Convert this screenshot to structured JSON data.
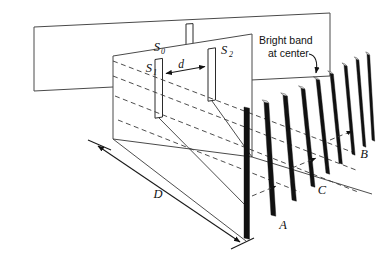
{
  "figure": {
    "type": "physics-diagram",
    "background_color": "#ffffff",
    "line_color": "#3a3a3a",
    "band_color": "#111111"
  },
  "labels": {
    "source_slit": "S",
    "source_slit_sub": "0",
    "slit_one": "S",
    "slit_one_sub": "1",
    "slit_two": "S",
    "slit_two_sub": "2",
    "slit_separation": "d",
    "screen_distance": "D",
    "fringe_a": "A",
    "fringe_b": "B",
    "fringe_c": "C",
    "callout_line1": "Bright band",
    "callout_line2": "at center"
  },
  "geometry": {
    "source_plane": {
      "points": "34,27 330,13 330,76 34,91",
      "slit": {
        "x": 188,
        "y": 23,
        "w": 7,
        "h": 45
      }
    },
    "double_slit_plane": {
      "points": "113,56 252,34 252,157 113,139",
      "slit_one": {
        "points": "155,59 163,58 163,117 155,118"
      },
      "slit_two": {
        "points": "208,48 216,47 216,100 208,101"
      }
    },
    "rays_solid": [
      "M66,48 L155,88",
      "M66,48 L163,72",
      "M66,48 L208,72",
      "M66,48 L216,57"
    ],
    "rays_dashed": [
      "M113,66 L340,150",
      "M113,80 L345,168",
      "M113,95 L348,186",
      "M118,118 L352,206"
    ],
    "rays_screen": [
      "M159,118 L248,200",
      "M212,101 L245,160"
    ],
    "ground_lines": [
      "M113,139 L248,242",
      "M252,157 L370,190"
    ],
    "dimension_D": {
      "start": {
        "x": 97,
        "y": 145
      },
      "end": {
        "x": 241,
        "y": 243
      },
      "tick_start": "M87,141 L110,150",
      "tick_end": "M231,248 L254,238",
      "label_pos": {
        "x": 158,
        "y": 196
      }
    },
    "slit_separation_arrow": {
      "from": {
        "x": 164,
        "y": 73
      },
      "to": {
        "x": 207,
        "y": 66
      },
      "label_pos": {
        "x": 183,
        "y": 67
      }
    },
    "callout": {
      "text_pos": {
        "x": 260,
        "y": 44
      },
      "leader": "M310,57 Q318,60 316,76"
    },
    "fringe_bands": [
      {
        "x_top": 244,
        "y_top": 107,
        "x_bot": 244,
        "y_bot": 238,
        "w": 5.5,
        "skew": 0
      },
      {
        "x_top": 264,
        "y_top": 102,
        "x_bot": 271,
        "y_bot": 215,
        "w": 4.8,
        "skew": 7
      },
      {
        "x_top": 283,
        "y_top": 95,
        "x_bot": 292,
        "y_bot": 200,
        "w": 4.4,
        "skew": 9
      },
      {
        "x_top": 301,
        "y_top": 88,
        "x_bot": 311,
        "y_bot": 186,
        "w": 4.0,
        "skew": 10
      },
      {
        "x_top": 316,
        "y_top": 79,
        "x_bot": 326,
        "y_bot": 173,
        "w": 3.7,
        "skew": 10
      },
      {
        "x_top": 330,
        "y_top": 73,
        "x_bot": 339,
        "y_bot": 163,
        "w": 3.4,
        "skew": 9
      },
      {
        "x_top": 344,
        "y_top": 65,
        "x_bot": 352,
        "y_bot": 154,
        "w": 3.1,
        "skew": 8
      },
      {
        "x_top": 356,
        "y_top": 59,
        "x_bot": 363,
        "y_bot": 146,
        "w": 2.9,
        "skew": 7
      },
      {
        "x_top": 367,
        "y_top": 54,
        "x_bot": 372,
        "y_bot": 140,
        "w": 2.7,
        "skew": 5
      }
    ],
    "fringe_label_positions": {
      "A": {
        "x": 283,
        "y": 227
      },
      "C": {
        "x": 322,
        "y": 192
      },
      "B": {
        "x": 363,
        "y": 156
      }
    }
  }
}
